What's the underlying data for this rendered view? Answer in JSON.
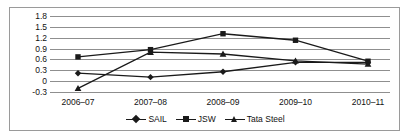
{
  "chart_data": {
    "type": "line",
    "title": "",
    "xlabel": "",
    "ylabel": "",
    "grid": true,
    "legend_position": "bottom",
    "categories": [
      "2006–07",
      "2007–08",
      "2008–09",
      "2009–10",
      "2010–11"
    ],
    "ylim": [
      -0.3,
      1.8
    ],
    "yticks": [
      1.8,
      1.5,
      1.2,
      0.9,
      0.6,
      0.3,
      0,
      -0.3
    ],
    "ytick_labels": [
      "1.8",
      "1.5",
      "1.2",
      "0.9",
      "0.6",
      "0.3",
      "0",
      "-0.3"
    ],
    "series": [
      {
        "name": "SAIL",
        "marker": "diamond",
        "color": "#1a1a1a",
        "values": [
          0.22,
          0.11,
          0.26,
          0.52,
          0.52
        ]
      },
      {
        "name": "JSW",
        "marker": "square",
        "color": "#1a1a1a",
        "values": [
          0.67,
          0.87,
          1.31,
          1.13,
          0.55
        ]
      },
      {
        "name": "Tata Steel",
        "marker": "triangle",
        "color": "#1a1a1a",
        "values": [
          -0.2,
          0.8,
          0.75,
          0.56,
          0.47
        ]
      }
    ]
  },
  "legend": {
    "entries": [
      {
        "label": "SAIL",
        "marker": "diamond"
      },
      {
        "label": "JSW",
        "marker": "square"
      },
      {
        "label": "Tata Steel",
        "marker": "triangle"
      }
    ]
  },
  "colors": {
    "line": "#1a1a1a",
    "grid": "#8f8f8f",
    "frame": "#9a9a9a",
    "text": "#111111",
    "background": "#ffffff"
  }
}
